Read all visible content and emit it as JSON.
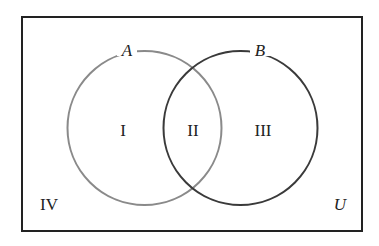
{
  "diagram": {
    "type": "venn",
    "universe": {
      "label": "U",
      "x": 22,
      "y": 17,
      "width": 340,
      "height": 214,
      "stroke": "#222222"
    },
    "sets": [
      {
        "label": "A",
        "cx": 144.5,
        "cy": 128,
        "r": 77,
        "stroke": "#8a8a8a"
      },
      {
        "label": "B",
        "cx": 240.5,
        "cy": 128,
        "r": 77,
        "stroke": "#3a3a3a"
      }
    ],
    "regions": [
      {
        "label": "I",
        "x": 123,
        "y": 136
      },
      {
        "label": "II",
        "x": 193,
        "y": 136
      },
      {
        "label": "III",
        "x": 263,
        "y": 136
      },
      {
        "label": "IV",
        "x": 49,
        "y": 210
      }
    ]
  }
}
